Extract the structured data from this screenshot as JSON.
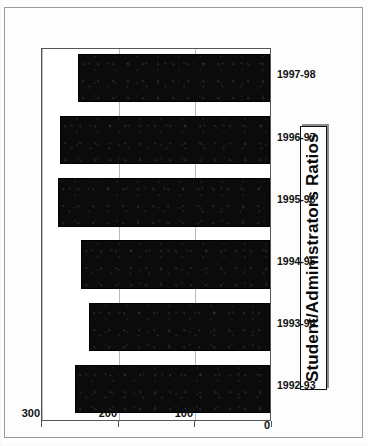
{
  "page": {
    "kind": "scanned-document-chart"
  },
  "chart": {
    "title": "Student/Administrators Ratios",
    "orientation_note": "90-degrees-counter-clockwise"
  },
  "axis": {
    "value_ticks": [
      "300",
      "200",
      "100",
      "0"
    ],
    "value_tick_numbers": [
      300,
      200,
      100,
      0
    ]
  },
  "chart_data": {
    "type": "bar",
    "title": "Student/Administrators Ratios",
    "xlabel": "",
    "ylabel": "",
    "orientation": "horizontal",
    "grid": true,
    "legend": "none",
    "ylim": [
      0,
      300
    ],
    "categories": [
      "1992-93",
      "1993-94",
      "1994-95",
      "1995-96",
      "1996-97",
      "1997-98"
    ],
    "values": [
      254,
      236,
      246,
      277,
      274,
      250
    ],
    "tick_labels": [
      "0",
      "100",
      "200",
      "300"
    ]
  },
  "bars": [
    {
      "category": "1992-93",
      "value": 254
    },
    {
      "category": "1993-94",
      "value": 236
    },
    {
      "category": "1994-95",
      "value": 246
    },
    {
      "category": "1995-96",
      "value": 277
    },
    {
      "category": "1996-97",
      "value": 274
    },
    {
      "category": "1997-98",
      "value": 250
    }
  ],
  "colors": {
    "bar": "#0b0b0b",
    "grid": "#b9b9b9",
    "axis": "#555555",
    "text": "#111111",
    "paper": "#fdfdfd"
  }
}
